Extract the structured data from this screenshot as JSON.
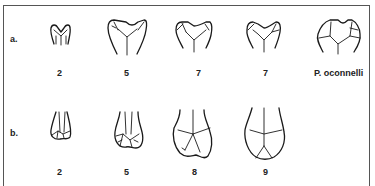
{
  "rows": [
    {
      "label": "a.",
      "figures": [
        {
          "caption": "2"
        },
        {
          "caption": "5"
        },
        {
          "caption": "7"
        },
        {
          "caption": "7"
        },
        {
          "caption": "P. oconnelli"
        }
      ]
    },
    {
      "label": "b.",
      "figures": [
        {
          "caption": "2"
        },
        {
          "caption": "5"
        },
        {
          "caption": "8"
        },
        {
          "caption": "9"
        }
      ]
    }
  ],
  "colors": {
    "line": "#1a1a1a",
    "frame": "#555555",
    "background": "#ffffff"
  }
}
